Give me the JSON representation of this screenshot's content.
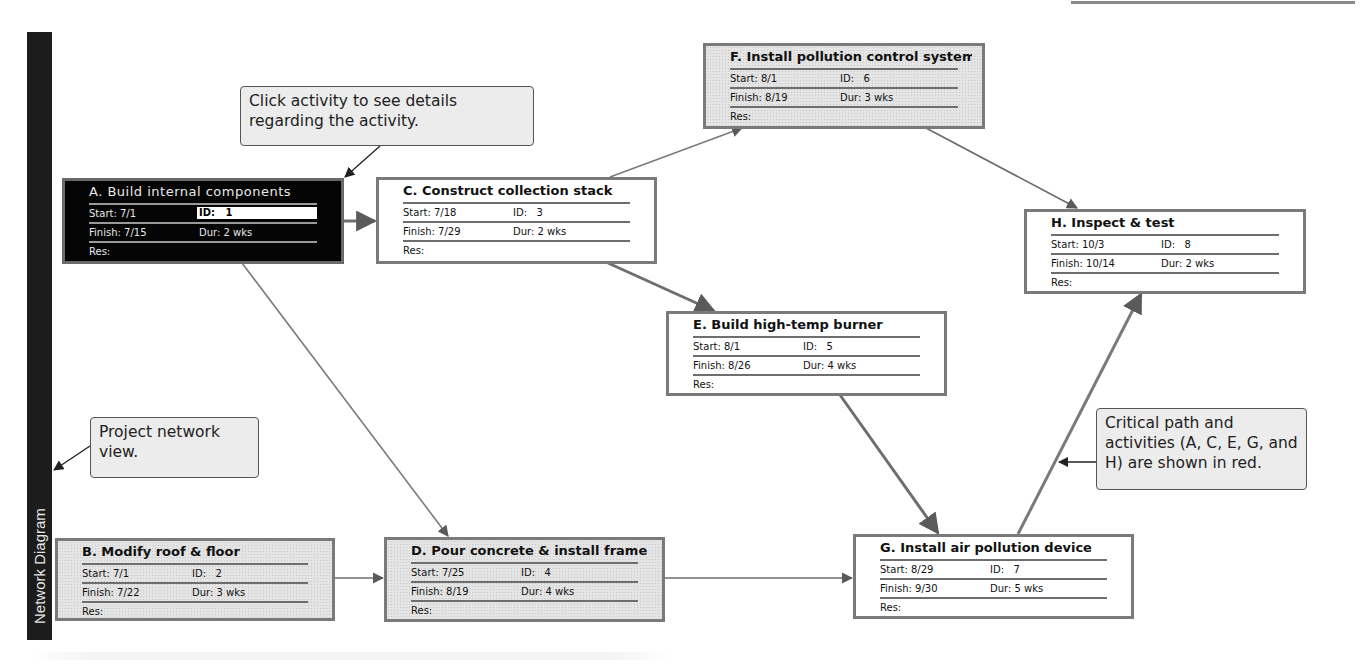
{
  "view": {
    "sidebar_tab": "Network Diagram",
    "theme": {
      "selected_node_bg": "#050505",
      "node_border": "#7a7a7a",
      "link_color": "#6e6e6e",
      "callout_bg": "#ececec"
    }
  },
  "field_labels": {
    "start": "Start:",
    "finish": "Finish:",
    "id": "ID:",
    "duration": "Dur:",
    "resources": "Res:"
  },
  "nodes": {
    "A": {
      "title": "A. Build internal components",
      "start": "7/1",
      "finish": "7/15",
      "id": "1",
      "duration": "2 wks",
      "critical": true,
      "selected": true
    },
    "B": {
      "title": "B. Modify roof & floor",
      "start": "7/1",
      "finish": "7/22",
      "id": "2",
      "duration": "3 wks",
      "critical": false,
      "selected": false
    },
    "C": {
      "title": "C. Construct collection stack",
      "start": "7/18",
      "finish": "7/29",
      "id": "3",
      "duration": "2 wks",
      "critical": true,
      "selected": false
    },
    "D": {
      "title": "D. Pour concrete & install frame",
      "start": "7/25",
      "finish": "8/19",
      "id": "4",
      "duration": "4 wks",
      "critical": false,
      "selected": false
    },
    "E": {
      "title": "E. Build high-temp burner",
      "start": "8/1",
      "finish": "8/26",
      "id": "5",
      "duration": "4 wks",
      "critical": true,
      "selected": false
    },
    "F": {
      "title": "F. Install pollution control system",
      "start": "8/1",
      "finish": "8/19",
      "id": "6",
      "duration": "3 wks",
      "critical": false,
      "selected": false
    },
    "G": {
      "title": "G. Install air pollution device",
      "start": "8/29",
      "finish": "9/30",
      "id": "7",
      "duration": "5 wks",
      "critical": true,
      "selected": false
    },
    "H": {
      "title": "H. Inspect & test",
      "start": "10/3",
      "finish": "10/14",
      "id": "8",
      "duration": "2 wks",
      "critical": true,
      "selected": false
    }
  },
  "links": [
    {
      "from": "A",
      "to": "C"
    },
    {
      "from": "A",
      "to": "D"
    },
    {
      "from": "B",
      "to": "D"
    },
    {
      "from": "C",
      "to": "F"
    },
    {
      "from": "C",
      "to": "E"
    },
    {
      "from": "F",
      "to": "H"
    },
    {
      "from": "E",
      "to": "G"
    },
    {
      "from": "D",
      "to": "G"
    },
    {
      "from": "G",
      "to": "H"
    }
  ],
  "callouts": {
    "click_activity": "Click activity to see details regarding the activity.",
    "project_network": "Project network view.",
    "critical_path": "Critical path and activities (A, C, E, G, and H) are shown in red."
  }
}
